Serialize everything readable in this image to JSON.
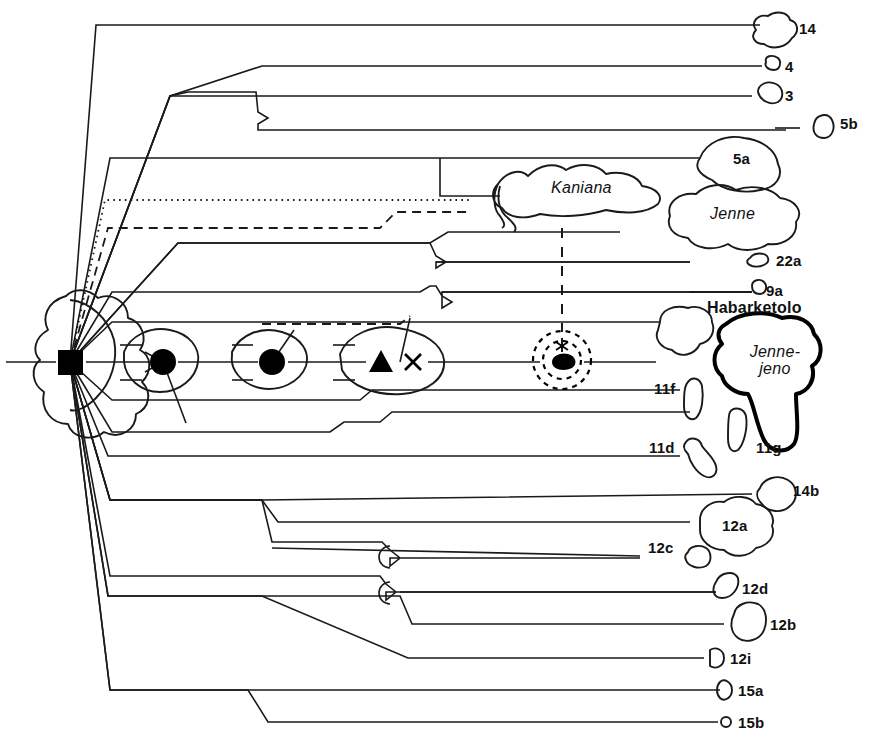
{
  "figure": {
    "stroke_color": "#1a1a1a",
    "thick_stroke_color": "#000000",
    "background": "#ffffff"
  },
  "site_labels": [
    {
      "id": "14",
      "text": "14",
      "x": 799,
      "y": 21,
      "style": "plain"
    },
    {
      "id": "4",
      "text": "4",
      "x": 785,
      "y": 59,
      "style": "plain"
    },
    {
      "id": "3",
      "text": "3",
      "x": 785,
      "y": 88,
      "style": "plain"
    },
    {
      "id": "5b",
      "text": "5b",
      "x": 840,
      "y": 116,
      "style": "plain"
    },
    {
      "id": "5a",
      "text": "5a",
      "x": 740,
      "y": 151,
      "style": "plain"
    },
    {
      "id": "Kaniana",
      "text": "Kaniana",
      "x": 554,
      "y": 181,
      "style": "italic"
    },
    {
      "id": "Jenne",
      "text": "Jenne",
      "x": 712,
      "y": 208,
      "style": "italic"
    },
    {
      "id": "22a",
      "text": "22a",
      "x": 778,
      "y": 253,
      "style": "plain"
    },
    {
      "id": "9a",
      "text": "9a",
      "x": 768,
      "y": 285,
      "style": "plain"
    },
    {
      "id": "Habarketolo",
      "text": "Habarketolo",
      "x": 707,
      "y": 302,
      "style": "site-name"
    },
    {
      "id": "Jenne-jeno",
      "text": "Jenne-\njeno",
      "x": 750,
      "y": 353,
      "style": "italic-two-line"
    },
    {
      "id": "11f",
      "text": "11f",
      "x": 656,
      "y": 381,
      "style": "plain"
    },
    {
      "id": "11g",
      "text": "11g",
      "x": 758,
      "y": 440,
      "style": "plain"
    },
    {
      "id": "11d",
      "text": "11d",
      "x": 651,
      "y": 440,
      "style": "plain"
    },
    {
      "id": "14b",
      "text": "14b",
      "x": 793,
      "y": 484,
      "style": "plain"
    },
    {
      "id": "12a",
      "text": "12a",
      "x": 730,
      "y": 526,
      "style": "plain"
    },
    {
      "id": "12c",
      "text": "12c",
      "x": 650,
      "y": 540,
      "style": "plain"
    },
    {
      "id": "12d",
      "text": "12d",
      "x": 742,
      "y": 582,
      "style": "plain"
    },
    {
      "id": "12b",
      "text": "12b",
      "x": 770,
      "y": 619,
      "style": "plain"
    },
    {
      "id": "12i",
      "text": "12i",
      "x": 730,
      "y": 653,
      "style": "plain"
    },
    {
      "id": "15a",
      "text": "15a",
      "x": 738,
      "y": 688,
      "style": "plain"
    },
    {
      "id": "15b",
      "text": "15b",
      "x": 738,
      "y": 720,
      "style": "plain"
    }
  ],
  "symbols": [
    {
      "id": "square",
      "name": "filled-square-marker",
      "x": 70,
      "y": 362
    },
    {
      "id": "circle-arrow",
      "name": "filled-circle-marker-1",
      "x": 163,
      "y": 362
    },
    {
      "id": "circle-plain",
      "name": "filled-circle-marker-2",
      "x": 272,
      "y": 362
    },
    {
      "id": "triangle",
      "name": "filled-triangle-marker",
      "x": 381,
      "y": 363
    },
    {
      "id": "cross",
      "name": "x-cross-marker",
      "x": 413,
      "y": 362
    },
    {
      "id": "dotted-rings",
      "name": "dashed-concentric-rings",
      "x": 562,
      "y": 360
    }
  ]
}
